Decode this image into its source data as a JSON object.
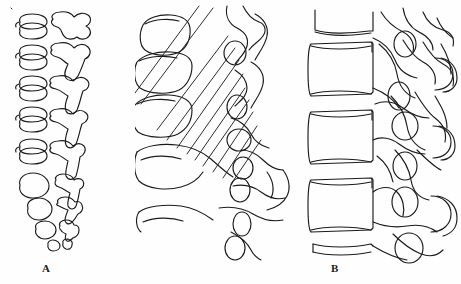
{
  "figure": {
    "kind": "anatomical-line-drawing",
    "background_color": "#fefefe",
    "ink_color": "#1b1b1b",
    "width": 461,
    "height": 284
  },
  "panels": [
    {
      "id": "A",
      "label": "A",
      "description": "superior-view series of vertebral bodies paired with posterior arch outlines, decreasing in size downward",
      "level_count": 9
    },
    {
      "id": "B",
      "label": "B",
      "description": "oblique view of cervical vertebrae with crossing articular pillar lines and intervertebral foramina",
      "foramina_count": 6
    },
    {
      "id": "C",
      "label": "C",
      "description": "lateral view of vertebrae with rectangular bodies, posterior elements and intervertebral foramina",
      "foramina_count": 5
    }
  ]
}
